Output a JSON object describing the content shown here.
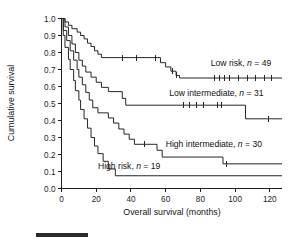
{
  "chart_data": {
    "type": "line",
    "title": "",
    "subtitle": "",
    "xlabel": "Overall survival (months)",
    "ylabel": "Cumulative survival",
    "xlim": [
      0,
      127
    ],
    "ylim": [
      0.0,
      1.0
    ],
    "xticks": [
      0,
      20,
      40,
      60,
      80,
      100,
      120
    ],
    "xtick_labels": [
      "0",
      "20",
      "40",
      "60",
      "80",
      "100",
      "120"
    ],
    "yticks": [
      0.0,
      0.1,
      0.2,
      0.3,
      0.4,
      0.5,
      0.6,
      0.7,
      0.8,
      0.9,
      1.0
    ],
    "ytick_labels": [
      "0.0",
      "0.1",
      "0.2",
      "0.3",
      "0.4",
      "0.5",
      "0.6",
      "0.7",
      "0.8",
      "0.9",
      "1.0"
    ],
    "grid": false,
    "legend_position": "inline-right-of-curves",
    "line_color": "#262626",
    "series": [
      {
        "name": "Low risk",
        "label": "Low risk, n = 49",
        "n": 49,
        "risk_group": "low",
        "steps": [
          [
            0,
            1.0
          ],
          [
            2,
            1.0
          ],
          [
            2,
            0.98
          ],
          [
            4,
            0.98
          ],
          [
            4,
            0.96
          ],
          [
            6,
            0.96
          ],
          [
            6,
            0.94
          ],
          [
            9,
            0.94
          ],
          [
            9,
            0.92
          ],
          [
            11,
            0.92
          ],
          [
            11,
            0.9
          ],
          [
            13,
            0.9
          ],
          [
            13,
            0.88
          ],
          [
            15,
            0.88
          ],
          [
            15,
            0.855
          ],
          [
            17,
            0.855
          ],
          [
            17,
            0.835
          ],
          [
            19,
            0.835
          ],
          [
            19,
            0.81
          ],
          [
            21,
            0.81
          ],
          [
            21,
            0.79
          ],
          [
            23,
            0.79
          ],
          [
            23,
            0.77
          ],
          [
            57,
            0.77
          ],
          [
            57,
            0.74
          ],
          [
            60,
            0.74
          ],
          [
            60,
            0.715
          ],
          [
            63,
            0.715
          ],
          [
            63,
            0.69
          ],
          [
            66,
            0.69
          ],
          [
            66,
            0.665
          ],
          [
            68,
            0.665
          ],
          [
            68,
            0.65
          ],
          [
            127,
            0.65
          ]
        ],
        "censor_times": [
          35,
          43,
          54,
          64,
          66,
          88,
          91,
          94,
          97,
          102,
          107,
          112,
          117,
          121
        ],
        "final_survival": 0.65
      },
      {
        "name": "Low intermediate",
        "label": "Low intermediate, n = 31",
        "n": 31,
        "risk_group": "low-intermediate",
        "steps": [
          [
            0,
            1.0
          ],
          [
            2,
            1.0
          ],
          [
            2,
            0.95
          ],
          [
            4,
            0.95
          ],
          [
            4,
            0.9
          ],
          [
            6,
            0.9
          ],
          [
            6,
            0.85
          ],
          [
            8,
            0.85
          ],
          [
            8,
            0.8
          ],
          [
            10,
            0.8
          ],
          [
            10,
            0.755
          ],
          [
            12,
            0.755
          ],
          [
            12,
            0.72
          ],
          [
            14,
            0.72
          ],
          [
            14,
            0.685
          ],
          [
            17,
            0.685
          ],
          [
            17,
            0.655
          ],
          [
            20,
            0.655
          ],
          [
            20,
            0.625
          ],
          [
            23,
            0.625
          ],
          [
            23,
            0.595
          ],
          [
            27,
            0.595
          ],
          [
            27,
            0.57
          ],
          [
            35,
            0.57
          ],
          [
            35,
            0.53
          ],
          [
            37,
            0.53
          ],
          [
            37,
            0.49
          ],
          [
            106,
            0.49
          ],
          [
            106,
            0.41
          ],
          [
            127,
            0.41
          ]
        ],
        "censor_times": [
          70,
          74,
          78,
          82,
          90,
          92,
          119
        ],
        "final_survival": 0.41
      },
      {
        "name": "High intermediate",
        "label": "High intermediate, n = 30",
        "n": 30,
        "risk_group": "high-intermediate",
        "steps": [
          [
            0,
            1.0
          ],
          [
            1,
            1.0
          ],
          [
            1,
            0.93
          ],
          [
            3,
            0.93
          ],
          [
            3,
            0.87
          ],
          [
            5,
            0.87
          ],
          [
            5,
            0.81
          ],
          [
            7,
            0.81
          ],
          [
            7,
            0.755
          ],
          [
            9,
            0.755
          ],
          [
            9,
            0.7
          ],
          [
            10,
            0.7
          ],
          [
            10,
            0.655
          ],
          [
            12,
            0.655
          ],
          [
            12,
            0.61
          ],
          [
            14,
            0.61
          ],
          [
            14,
            0.565
          ],
          [
            16,
            0.565
          ],
          [
            16,
            0.52
          ],
          [
            18,
            0.52
          ],
          [
            18,
            0.475
          ],
          [
            21,
            0.475
          ],
          [
            21,
            0.445
          ],
          [
            27,
            0.445
          ],
          [
            27,
            0.415
          ],
          [
            30,
            0.415
          ],
          [
            30,
            0.385
          ],
          [
            33,
            0.385
          ],
          [
            33,
            0.35
          ],
          [
            36,
            0.35
          ],
          [
            36,
            0.32
          ],
          [
            39,
            0.32
          ],
          [
            39,
            0.29
          ],
          [
            42,
            0.29
          ],
          [
            42,
            0.26
          ],
          [
            55,
            0.26
          ],
          [
            55,
            0.225
          ],
          [
            58,
            0.225
          ],
          [
            58,
            0.185
          ],
          [
            93,
            0.185
          ],
          [
            93,
            0.145
          ],
          [
            127,
            0.145
          ]
        ],
        "censor_times": [
          48,
          95
        ],
        "final_survival": 0.145
      },
      {
        "name": "High risk",
        "label": "High risk, n = 19",
        "n": 19,
        "risk_group": "high",
        "steps": [
          [
            0,
            1.0
          ],
          [
            1,
            1.0
          ],
          [
            1,
            0.9
          ],
          [
            2,
            0.9
          ],
          [
            2,
            0.83
          ],
          [
            4,
            0.83
          ],
          [
            4,
            0.76
          ],
          [
            5,
            0.76
          ],
          [
            5,
            0.7
          ],
          [
            7,
            0.7
          ],
          [
            7,
            0.635
          ],
          [
            8,
            0.635
          ],
          [
            8,
            0.575
          ],
          [
            10,
            0.575
          ],
          [
            10,
            0.52
          ],
          [
            11,
            0.52
          ],
          [
            11,
            0.465
          ],
          [
            13,
            0.465
          ],
          [
            13,
            0.41
          ],
          [
            15,
            0.41
          ],
          [
            15,
            0.355
          ],
          [
            17,
            0.355
          ],
          [
            17,
            0.3
          ],
          [
            19,
            0.3
          ],
          [
            19,
            0.25
          ],
          [
            21,
            0.25
          ],
          [
            21,
            0.205
          ],
          [
            24,
            0.205
          ],
          [
            24,
            0.16
          ],
          [
            27,
            0.16
          ],
          [
            27,
            0.115
          ],
          [
            31,
            0.115
          ],
          [
            31,
            0.075
          ],
          [
            127,
            0.075
          ]
        ],
        "censor_times": [],
        "final_survival": 0.075
      }
    ],
    "annotations": [
      {
        "text": "Low risk, n = 49",
        "x": 86,
        "y": 0.72
      },
      {
        "text": "Low intermediate, n = 31",
        "x": 62,
        "y": 0.545
      },
      {
        "text": "High intermediate, n = 30",
        "x": 60,
        "y": 0.245
      },
      {
        "text": "High risk, n = 19",
        "x": 21,
        "y": 0.115
      }
    ]
  },
  "labels": {
    "low_risk": {
      "prefix": "Low risk, ",
      "n_symbol": "n",
      "equals": " = ",
      "value": "49"
    },
    "low_intermediate": {
      "prefix": "Low intermediate, ",
      "n_symbol": "n",
      "equals": " = ",
      "value": "31"
    },
    "high_intermediate": {
      "prefix": "High intermediate, ",
      "n_symbol": "n",
      "equals": " = ",
      "value": "30"
    },
    "high_risk": {
      "prefix": "High risk, ",
      "n_symbol": "n",
      "equals": " = ",
      "value": "19"
    }
  },
  "axes": {
    "x_title": "Overall survival (months)",
    "y_title": "Cumulative survival",
    "x_tick_labels": [
      "0",
      "20",
      "40",
      "60",
      "80",
      "100",
      "120"
    ],
    "y_tick_labels": [
      "1.0",
      "0.9",
      "0.8",
      "0.7",
      "0.6",
      "0.5",
      "0.4",
      "0.3",
      "0.2",
      "0.1",
      "0.0"
    ]
  }
}
